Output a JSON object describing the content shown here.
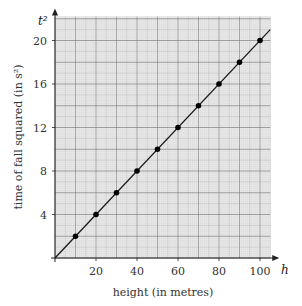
{
  "chart_data": {
    "type": "line",
    "title": "",
    "xlabel": "height (in metres)",
    "ylabel": "time of fall squared (in s²)",
    "x_var": "h",
    "y_var": "t²",
    "xlim": [
      0,
      105
    ],
    "ylim": [
      0,
      22.2
    ],
    "x_ticks": [
      20,
      40,
      60,
      80,
      100
    ],
    "y_ticks": [
      4,
      8,
      12,
      16,
      20
    ],
    "grid": true,
    "legend": null,
    "series": [
      {
        "name": "measured points",
        "type": "scatter",
        "x": [
          10,
          20,
          30,
          40,
          50,
          60,
          70,
          80,
          90,
          100
        ],
        "y": [
          2,
          4,
          6,
          8,
          10,
          12,
          14,
          16,
          18,
          20
        ]
      },
      {
        "name": "line of best fit",
        "type": "line",
        "x": [
          0,
          105
        ],
        "y": [
          0,
          21
        ]
      }
    ],
    "colors": {
      "grid_bg": "#ececec",
      "grid_minor": "#d2d2d2",
      "grid_mid": "#b4b4b4",
      "grid_major": "#8a8a8a",
      "line": "#1a1a1a",
      "points": "#000000"
    }
  }
}
